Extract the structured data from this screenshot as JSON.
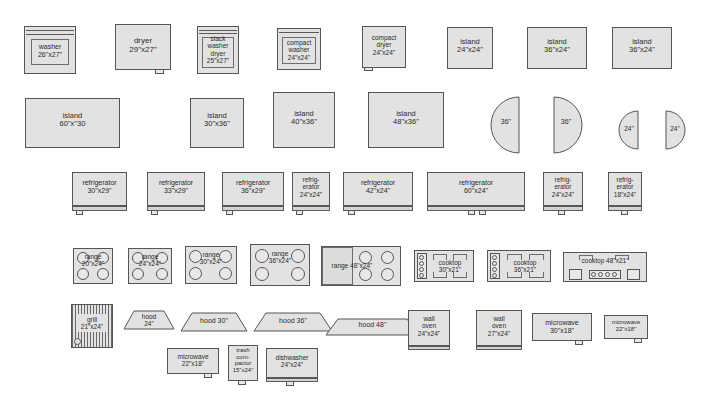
{
  "palette": {
    "title": "appliance symbol palette",
    "background_color": "#ffffff",
    "fill_color": "#e2e2e2",
    "stroke_color": "#555555",
    "text_color": "#2b2b2b",
    "rows": [
      {
        "row_name": "laundry-and-small-islands",
        "items": [
          {
            "name": "washer",
            "label": "washer\n26\"x27\"",
            "kind": "washer"
          },
          {
            "name": "dryer",
            "label": "dryer\n29\"x27\"",
            "kind": "dryer"
          },
          {
            "name": "stack-washer-dryer",
            "label": "stack\nwasher\ndryer\n25\"x27\"",
            "kind": "stack"
          },
          {
            "name": "compact-washer",
            "label": "compact\nwasher\n24\"x24\"",
            "kind": "compact-washer"
          },
          {
            "name": "compact-dryer",
            "label": "compact\ndryer\n24\"x24\"",
            "kind": "compact-dryer"
          },
          {
            "name": "island-24x24",
            "label": "island\n24\"x24\"",
            "kind": "plain"
          },
          {
            "name": "island-36x24-a",
            "label": "island\n36\"x24\"",
            "kind": "plain"
          },
          {
            "name": "island-36x24-b",
            "label": "island\n36\"x24\"",
            "kind": "plain"
          }
        ]
      },
      {
        "row_name": "large-islands-and-round-islands",
        "items": [
          {
            "name": "island-60x30",
            "label": "island\n60\"x\"30",
            "kind": "plain"
          },
          {
            "name": "island-30x36",
            "label": "island\n30\"x36\"",
            "kind": "plain"
          },
          {
            "name": "island-40x36",
            "label": "island\n40\"x36\"",
            "kind": "plain"
          },
          {
            "name": "island-48x36",
            "label": "island\n48\"x36\"",
            "kind": "plain"
          },
          {
            "name": "half-round-36-left",
            "label": "36\"",
            "kind": "half-left"
          },
          {
            "name": "half-round-36-right",
            "label": "36\"",
            "kind": "half-right"
          },
          {
            "name": "half-round-24-left",
            "label": "24\"",
            "kind": "half-left"
          },
          {
            "name": "half-round-24-right",
            "label": "24\"",
            "kind": "half-right"
          }
        ]
      },
      {
        "row_name": "refrigerators",
        "items": [
          {
            "name": "refrigerator-30x29",
            "label": "refrigerator\n30\"x29\"",
            "kind": "fridge"
          },
          {
            "name": "refrigerator-33x29",
            "label": "refrigerator\n33\"x29\"",
            "kind": "fridge"
          },
          {
            "name": "refrigerator-36x29",
            "label": "refrigerator\n36\"x29\"",
            "kind": "fridge"
          },
          {
            "name": "refrigerator-24x24",
            "label": "refrig-\nerator\n24\"x24\"",
            "kind": "fridge"
          },
          {
            "name": "refrigerator-42x24",
            "label": "refrigerator\n42\"x24\"",
            "kind": "fridge"
          },
          {
            "name": "refrigerator-60x24",
            "label": "refrigerator\n60\"x24\"",
            "kind": "fridge-double"
          },
          {
            "name": "refrigerator-24x24-b",
            "label": "refrig-\nerator\n24\"x24\"",
            "kind": "fridge"
          },
          {
            "name": "refrigerator-18x24",
            "label": "refrig-\nerator\n18\"x24\"",
            "kind": "fridge"
          }
        ]
      },
      {
        "row_name": "ranges-and-cooktops",
        "items": [
          {
            "name": "range-20x24",
            "label": "range\n20\"x24\"",
            "kind": "range4"
          },
          {
            "name": "range-24x24",
            "label": "range\n24\"x24\"",
            "kind": "range4"
          },
          {
            "name": "range-30x24",
            "label": "range\n30\"x24\"",
            "kind": "range4"
          },
          {
            "name": "range-36x24",
            "label": "range\n36\"x24\"",
            "kind": "range4"
          },
          {
            "name": "range-48x24",
            "label": "range 48\"x24\"",
            "kind": "range48"
          },
          {
            "name": "cooktop-30x21",
            "label": "cooktop\n30\"x21\"",
            "kind": "cooktop"
          },
          {
            "name": "cooktop-36x21",
            "label": "cooktop\n36\"x21\"",
            "kind": "cooktop"
          },
          {
            "name": "cooktop-48x21",
            "label": "cooktop  48\"x21\"",
            "kind": "cooktop48"
          }
        ]
      },
      {
        "row_name": "grill-hoods-ovens-microwaves",
        "items": [
          {
            "name": "grill-21x24",
            "label": "grill\n21\"x24\"",
            "kind": "grill"
          },
          {
            "name": "hood-24",
            "label": "hood\n24\"",
            "kind": "hood"
          },
          {
            "name": "hood-30",
            "label": "hood 30\"",
            "kind": "hood"
          },
          {
            "name": "hood-36",
            "label": "hood 36\"",
            "kind": "hood"
          },
          {
            "name": "hood-48",
            "label": "hood 48\"",
            "kind": "hood"
          },
          {
            "name": "wall-oven-24x24",
            "label": "wall\noven\n24\"x24\"",
            "kind": "oven"
          },
          {
            "name": "wall-oven-27x24",
            "label": "wall\noven\n27\"x24\"",
            "kind": "oven"
          },
          {
            "name": "microwave-30x18",
            "label": "microwave\n30\"x18\"",
            "kind": "microwave"
          },
          {
            "name": "microwave-22x18",
            "label": "microwave\n22\"x18\"",
            "kind": "microwave"
          }
        ]
      },
      {
        "row_name": "microwave-compactor-dishwasher",
        "items": [
          {
            "name": "microwave-22x18-b",
            "label": "microwave\n22\"x18\"",
            "kind": "microwave"
          },
          {
            "name": "trash-compactor-15x24",
            "label": "trash\ncom-\npactor\n15\"x24\"",
            "kind": "compactor"
          },
          {
            "name": "dishwasher-24x24",
            "label": "dishwasher\n24\"x24\"",
            "kind": "dishwasher"
          }
        ]
      }
    ]
  }
}
